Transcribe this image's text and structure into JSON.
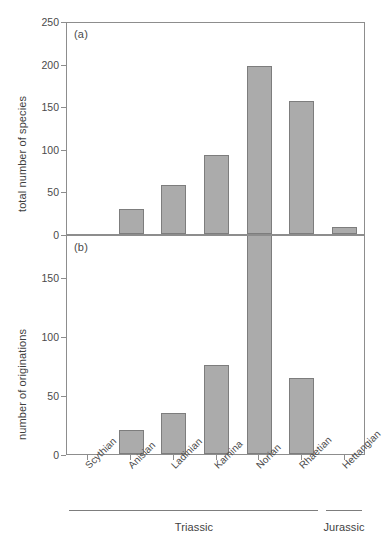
{
  "figure": {
    "panel_a_tag": "(a)",
    "panel_b_tag": "(b)"
  },
  "axes": {
    "panel_a_ylabel": "total number of species",
    "panel_b_ylabel": "number of originations",
    "panel_a_ticks": [
      "0",
      "50",
      "100",
      "150",
      "200",
      "250"
    ],
    "panel_b_ticks": [
      "0",
      "50",
      "100",
      "150"
    ]
  },
  "stages": [
    "Scythian",
    "Anisian",
    "Ladinian",
    "Karnina",
    "Norian",
    "Rhaetian",
    "Hettangian"
  ],
  "periods": [
    {
      "name": "Triassic",
      "start_stage": 0,
      "end_stage": 5
    },
    {
      "name": "Jurassic",
      "start_stage": 6,
      "end_stage": 6
    }
  ],
  "colors": {
    "bar_fill": "#ababab",
    "bar_stroke": "#7d7d7d",
    "axis": "#8d8d8d",
    "text": "#4a4a4a",
    "background": "#ffffff"
  },
  "chart_data": [
    {
      "type": "bar",
      "panel": "(a)",
      "title": "",
      "xlabel": "",
      "ylabel": "total number of species",
      "categories": [
        "Scythian",
        "Anisian",
        "Ladinian",
        "Karnina",
        "Norian",
        "Rhaetian",
        "Hettangian"
      ],
      "values": [
        0,
        29,
        58,
        93,
        197,
        156,
        8
      ],
      "ylim": [
        0,
        250
      ],
      "ytick_values": [
        0,
        50,
        100,
        150,
        200,
        250
      ],
      "grid": false,
      "legend": "none"
    },
    {
      "type": "bar",
      "panel": "(b)",
      "title": "",
      "xlabel": "",
      "ylabel": "number of originations",
      "categories": [
        "Scythian",
        "Anisian",
        "Ladinian",
        "Karnina",
        "Norian",
        "Rhaetian",
        "Hettangian"
      ],
      "values": [
        0,
        20,
        35,
        75,
        190,
        64,
        0
      ],
      "ylim": [
        0,
        186
      ],
      "ytick_values": [
        0,
        50,
        100,
        150
      ],
      "grid": false,
      "legend": "none",
      "note": "Norian bar is clipped at the top of the panel"
    }
  ]
}
